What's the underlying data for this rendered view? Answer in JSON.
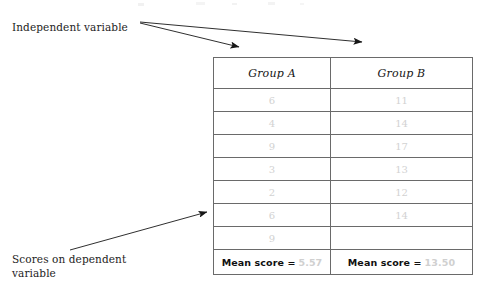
{
  "figure": {
    "annotations": {
      "independent_variable": "Independent variable",
      "scores_dependent_variable": "Scores on dependent\nvariable"
    },
    "table": {
      "headers": [
        "Group A",
        "Group B"
      ],
      "rows": [
        [
          "6",
          "11"
        ],
        [
          "4",
          "14"
        ],
        [
          "9",
          "17"
        ],
        [
          "3",
          "13"
        ],
        [
          "2",
          "12"
        ],
        [
          "6",
          "14"
        ],
        [
          "9",
          ""
        ]
      ],
      "summary": {
        "label": "Mean score =",
        "group_a_mean": "5.57",
        "group_b_mean": "13.50"
      }
    },
    "colors": {
      "ink": "#1d1d1d",
      "table_border": "#6a6a6a",
      "faded_value": "#d2d2d2",
      "page_background": "#ffffff"
    }
  }
}
